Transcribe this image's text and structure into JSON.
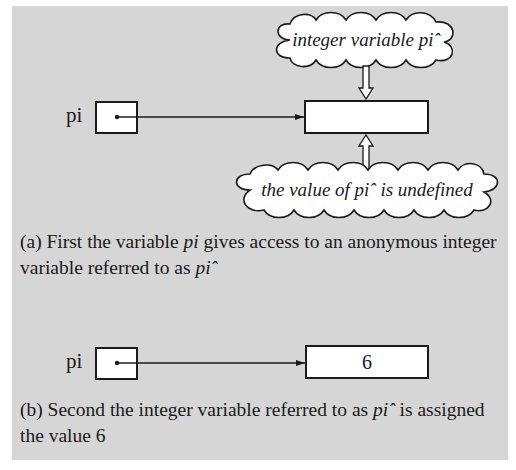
{
  "figure": {
    "diagram_a": {
      "pointer_label": "pi",
      "value_box_content": "",
      "cloud_top": "integer variable piˆ",
      "cloud_bottom": "the value of piˆ is undefined",
      "caption": {
        "prefix": "(a) First the variable ",
        "italic1": "pi",
        "middle": " gives access to an anonymous integer variable referred to as ",
        "italic2": "piˆ"
      }
    },
    "diagram_b": {
      "pointer_label": "pi",
      "value_box_content": "6",
      "caption": {
        "prefix": "(b) Second the integer variable referred to as ",
        "italic1": "piˆ",
        "suffix": " is assigned the value 6"
      }
    },
    "colors": {
      "panel_background": "#d6d6d6",
      "box_fill": "#ffffff",
      "stroke": "#1a1a1a"
    }
  }
}
